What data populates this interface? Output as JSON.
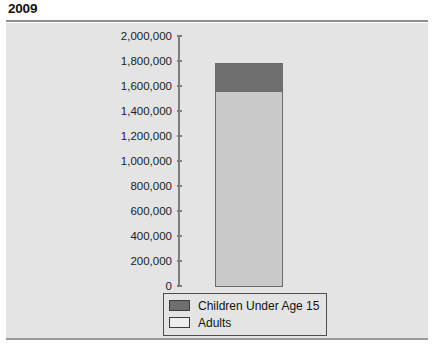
{
  "page_title": "2009",
  "chart_data": {
    "type": "bar",
    "subtype": "stacked-column",
    "title": "2009",
    "xlabel": "",
    "ylabel": "",
    "categories": [
      "2009"
    ],
    "series": [
      {
        "name": "Adults",
        "values": [
          1570000
        ],
        "color": "#c9c9c9"
      },
      {
        "name": "Children Under Age 15",
        "values": [
          230000
        ],
        "color": "#6f6f6f"
      }
    ],
    "stack_total": [
      1800000
    ],
    "ylim": [
      0,
      2000000
    ],
    "ytick_values": [
      2000000,
      1800000,
      1600000,
      1400000,
      1200000,
      1000000,
      800000,
      600000,
      400000,
      200000,
      0
    ],
    "ytick_labels": [
      "2,000,000",
      "1,800,000",
      "1,600,000",
      "1,400,000",
      "1,200,000",
      "1,000,000",
      "800,000",
      "600,000",
      "400,000",
      "200,000",
      "0"
    ],
    "grid": false,
    "legend_position": "bottom",
    "legend_entries": [
      {
        "label": "Children Under Age 15",
        "color": "#6f6f6f"
      },
      {
        "label": "Adults",
        "color": "#eeeeee"
      }
    ]
  },
  "colors": {
    "panel_background": "#e4e4e4",
    "axis": "#7d7d7d",
    "children_segment": "#6f6f6f",
    "adults_segment": "#c9c9c9",
    "text": "#121212"
  }
}
